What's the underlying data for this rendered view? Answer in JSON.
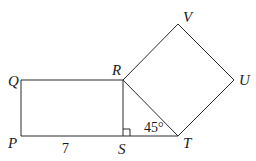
{
  "figure": {
    "vertices": {
      "P": "P",
      "Q": "Q",
      "R": "R",
      "S": "S",
      "T": "T",
      "U": "U",
      "V": "V"
    },
    "measurements": {
      "PS_length": "7",
      "angle_RTS": "45°"
    },
    "right_angle_at": "S",
    "shapes": [
      "rectangle PQRS",
      "triangle RST",
      "square RTUV"
    ]
  }
}
